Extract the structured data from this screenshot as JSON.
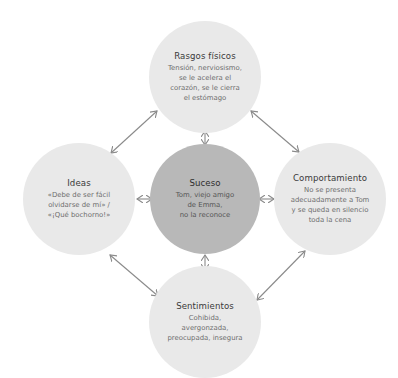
{
  "diagram": {
    "type": "cognitive-model-cycle",
    "colors": {
      "outer_node_fill": "#e9e9e9",
      "center_node_fill": "#b8b8b8",
      "arrow_color": "#8a8a8a",
      "title_text": "#3a3a3a",
      "body_text": "#6e6e6e"
    },
    "nodes": {
      "top": {
        "title": "Rasgos físicos",
        "lines": [
          "Tensión, nerviosismo,",
          "se le acelera el",
          "corazón, se le cierra",
          "el estómago"
        ]
      },
      "left": {
        "title": "Ideas",
        "lines": [
          "«Debe de ser fácil",
          "olvidarse de mí» /",
          "«¡Qué bochorno!»"
        ]
      },
      "center": {
        "title": "Suceso",
        "lines": [
          "Tom, viejo amigo",
          "de Emma,",
          "no la reconoce"
        ]
      },
      "right": {
        "title": "Comportamiento",
        "lines": [
          "No se presenta",
          "adecuadamente a Tom",
          "y se queda en silencio",
          "toda la cena"
        ]
      },
      "bottom": {
        "title": "Sentimientos",
        "lines": [
          "Cohibida,",
          "avergonzada,",
          "preocupada, insegura"
        ]
      }
    },
    "connections": [
      {
        "from": "top",
        "to": "left",
        "style": "double-arrow"
      },
      {
        "from": "top",
        "to": "right",
        "style": "double-arrow"
      },
      {
        "from": "left",
        "to": "bottom",
        "style": "double-arrow"
      },
      {
        "from": "right",
        "to": "bottom",
        "style": "double-arrow"
      },
      {
        "from": "center",
        "to": "top",
        "style": "double-arrow"
      },
      {
        "from": "center",
        "to": "left",
        "style": "double-arrow"
      },
      {
        "from": "center",
        "to": "right",
        "style": "double-arrow"
      },
      {
        "from": "center",
        "to": "bottom",
        "style": "double-arrow"
      }
    ]
  }
}
